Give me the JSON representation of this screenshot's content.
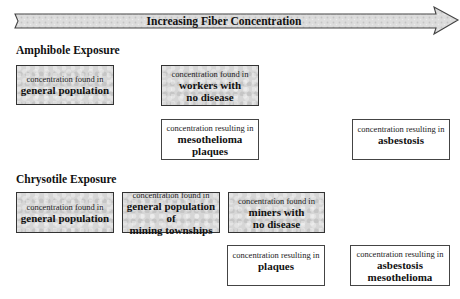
{
  "arrow": {
    "label": "Increasing Fiber Concentration",
    "fill": "#d9d9d9",
    "stroke": "#444444"
  },
  "amphibole": {
    "heading": "Amphibole Exposure",
    "boxes": [
      {
        "prefix": "concentration found in",
        "lines": [
          "general population"
        ],
        "style": "shaded"
      },
      {
        "prefix": "concentration found in",
        "lines": [
          "workers with",
          "no disease"
        ],
        "style": "shaded"
      },
      {
        "prefix": "concentration resulting in",
        "lines": [
          "mesothelioma",
          "plaques"
        ],
        "style": "plain"
      },
      {
        "prefix": "concentration resulting in",
        "lines": [
          "asbestosis"
        ],
        "style": "plain"
      }
    ]
  },
  "chrysotile": {
    "heading": "Chrysotile Exposure",
    "boxes": [
      {
        "prefix": "concentration found in",
        "lines": [
          "general population"
        ],
        "style": "shaded"
      },
      {
        "prefix": "concentration found in",
        "lines": [
          "general population of",
          "mining townships"
        ],
        "style": "shaded"
      },
      {
        "prefix": "concentration found in",
        "lines": [
          "miners with",
          "no disease"
        ],
        "style": "shaded"
      },
      {
        "prefix": "concentration resulting in",
        "lines": [
          "plaques"
        ],
        "style": "plain"
      },
      {
        "prefix": "concentration resulting in",
        "lines": [
          "asbestosis",
          "mesothelioma"
        ],
        "style": "plain"
      }
    ]
  }
}
